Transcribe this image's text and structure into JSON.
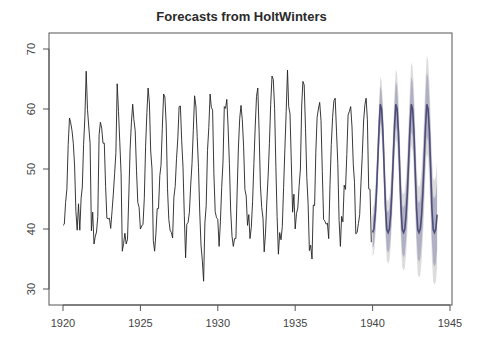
{
  "chart_data": {
    "type": "line",
    "title": "Forecasts from HoltWinters",
    "xlabel": "",
    "ylabel": "",
    "xlim": [
      1919.1,
      1945.0
    ],
    "ylim": [
      27.4,
      73.0
    ],
    "x_ticks": [
      1920,
      1925,
      1930,
      1935,
      1940,
      1945
    ],
    "y_ticks": [
      30,
      40,
      50,
      60,
      70
    ],
    "grid": false,
    "legend": "none",
    "series": [
      {
        "name": "observed",
        "start": 1920,
        "frequency": 12,
        "color": "#222222",
        "values": [
          40.6,
          40.8,
          44.4,
          46.7,
          54.1,
          58.5,
          57.7,
          56.4,
          54.3,
          50.5,
          42.9,
          39.8,
          44.2,
          39.8,
          45.1,
          47.0,
          54.1,
          58.7,
          66.3,
          59.9,
          57.0,
          54.2,
          39.7,
          42.8,
          37.5,
          38.7,
          39.5,
          42.1,
          55.7,
          57.8,
          56.8,
          54.3,
          54.3,
          47.1,
          41.8,
          41.7,
          41.8,
          40.1,
          42.9,
          45.8,
          49.2,
          52.7,
          64.2,
          59.6,
          54.4,
          49.2,
          36.3,
          37.6,
          39.3,
          37.5,
          38.3,
          45.5,
          53.2,
          57.7,
          60.8,
          58.2,
          56.4,
          49.8,
          44.4,
          43.6,
          40.0,
          40.5,
          40.8,
          45.1,
          53.8,
          59.4,
          63.5,
          61.0,
          53.0,
          50.0,
          38.1,
          36.3,
          39.2,
          43.4,
          43.4,
          48.9,
          50.6,
          56.8,
          62.5,
          62.0,
          57.5,
          46.7,
          41.6,
          39.8,
          39.4,
          38.5,
          45.3,
          47.1,
          51.7,
          55.0,
          60.4,
          60.5,
          54.7,
          50.3,
          42.3,
          35.2,
          40.8,
          41.1,
          42.8,
          47.3,
          50.9,
          56.4,
          62.2,
          60.5,
          55.4,
          50.2,
          43.0,
          37.3,
          34.8,
          31.3,
          41.0,
          43.9,
          53.1,
          56.9,
          62.5,
          60.3,
          59.8,
          49.2,
          42.9,
          41.9,
          41.6,
          37.1,
          41.2,
          46.9,
          51.2,
          60.4,
          60.1,
          61.6,
          57.0,
          50.9,
          43.0,
          38.8,
          37.1,
          38.4,
          38.4,
          46.5,
          53.5,
          58.4,
          60.6,
          58.2,
          53.8,
          46.6,
          45.5,
          40.6,
          42.4,
          38.4,
          40.3,
          44.6,
          50.9,
          57.0,
          62.1,
          63.5,
          56.3,
          47.3,
          43.6,
          41.8,
          36.2,
          39.3,
          44.5,
          48.7,
          54.2,
          60.8,
          65.5,
          64.9,
          60.1,
          50.2,
          42.1,
          35.8,
          39.4,
          38.2,
          40.4,
          46.9,
          53.4,
          59.6,
          66.5,
          60.4,
          59.2,
          51.2,
          42.8,
          45.8,
          40.0,
          42.6,
          43.5,
          47.1,
          50.0,
          60.5,
          64.6,
          64.0,
          56.8,
          48.6,
          44.2,
          36.4,
          37.3,
          35.0,
          44.0,
          43.9,
          52.7,
          58.6,
          60.0,
          61.1,
          58.1,
          49.6,
          41.6,
          41.3,
          40.8,
          41.0,
          38.4,
          47.4,
          54.1,
          58.6,
          61.4,
          61.8,
          56.3,
          50.9,
          41.4,
          37.1,
          42.1,
          41.2,
          47.3,
          46.6,
          52.4,
          59.0,
          59.6,
          60.4,
          57.0,
          50.7,
          47.8,
          39.2,
          39.4,
          40.9,
          42.4,
          47.8,
          52.4,
          58.0,
          60.7,
          61.8,
          58.2,
          46.7,
          46.6,
          37.8
        ]
      },
      {
        "name": "forecast",
        "start": 1940,
        "frequency": 12,
        "color": "#4d4d7a",
        "values": [
          39.4,
          40.0,
          42.4,
          46.2,
          51.6,
          57.0,
          60.8,
          60.0,
          56.2,
          49.9,
          43.5,
          39.9,
          39.4,
          40.0,
          42.4,
          46.2,
          51.6,
          57.0,
          60.8,
          60.0,
          56.2,
          49.9,
          43.5,
          39.9,
          39.4,
          40.0,
          42.4,
          46.2,
          51.6,
          57.0,
          60.8,
          60.0,
          56.2,
          49.9,
          43.5,
          39.9,
          39.4,
          40.0,
          42.4,
          46.2,
          51.6,
          57.0,
          60.8,
          60.0,
          56.2,
          49.9,
          43.5,
          39.9,
          39.4,
          40.0,
          42.4
        ]
      },
      {
        "name": "80% interval",
        "color": "#b0b0c4",
        "half_width_start": 2.6,
        "half_width_end": 5.8
      },
      {
        "name": "95% interval",
        "color": "#dcdcdc",
        "half_width_start": 4.0,
        "half_width_end": 8.9
      }
    ]
  }
}
